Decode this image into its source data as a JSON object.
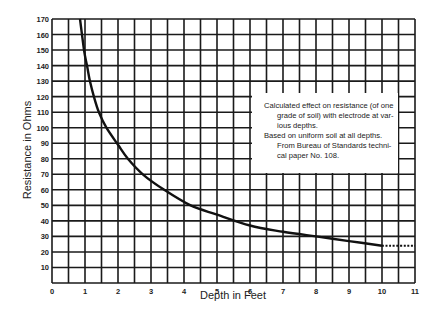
{
  "chart_data": {
    "type": "line",
    "title": "",
    "xlabel": "Depth in Feet",
    "ylabel": "Resistance in Ohms",
    "xlim": [
      0,
      11
    ],
    "ylim": [
      0,
      170
    ],
    "x_ticks": [
      "0",
      "1",
      "2",
      "3",
      "4",
      "5",
      "6",
      "7",
      "8",
      "9",
      "10",
      "11"
    ],
    "y_ticks": [
      "10",
      "20",
      "30",
      "40",
      "50",
      "60",
      "70",
      "80",
      "90",
      "100",
      "110",
      "120",
      "130",
      "140",
      "150",
      "160",
      "170"
    ],
    "grid": true,
    "grid_x_step": 0.5,
    "grid_y_step": 10,
    "series": [
      {
        "name": "Calculated resistance",
        "style": "solid",
        "x": [
          0.85,
          0.97,
          1.06,
          1.15,
          1.27,
          1.42,
          1.65,
          2.0,
          2.3,
          2.75,
          3.4,
          4.2,
          5.0,
          6.0,
          7.0,
          8.0,
          9.0,
          10.0
        ],
        "y": [
          170,
          150,
          140,
          130,
          120,
          110,
          100,
          89,
          80,
          70,
          60,
          50,
          44,
          37,
          33,
          30,
          27,
          24
        ]
      },
      {
        "name": "Extrapolated",
        "style": "dotted",
        "x": [
          10.0,
          11.0
        ],
        "y": [
          24,
          24
        ]
      }
    ],
    "annotation": {
      "lines": [
        "Calculated effect on resistance (of one",
        "grade of soil) with electrode at var-",
        "ious depths.",
        "Based on uniform soil at all depths.",
        "From Bureau of Standards techni-",
        "cal paper No. 108."
      ],
      "indented": [
        false,
        true,
        true,
        false,
        true,
        true
      ]
    }
  }
}
